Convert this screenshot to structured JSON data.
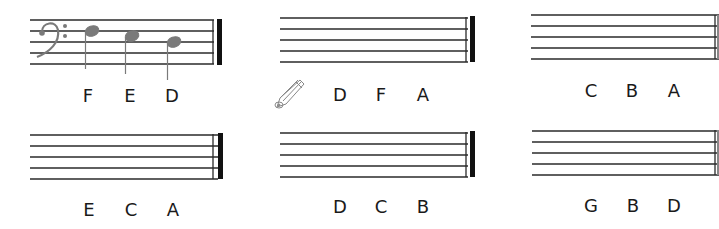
{
  "worksheet": {
    "exercises": [
      {
        "id": 1,
        "clef": "bass",
        "notes_drawn": [
          "F",
          "E",
          "D"
        ],
        "labels": [
          "F",
          "E",
          "D"
        ],
        "hint_icon": null
      },
      {
        "id": 2,
        "clef": null,
        "notes_drawn": [],
        "labels": [
          "D",
          "F",
          "A"
        ],
        "hint_icon": "pencil-icon"
      },
      {
        "id": 3,
        "clef": null,
        "notes_drawn": [],
        "labels": [
          "C",
          "B",
          "A"
        ],
        "hint_icon": null
      },
      {
        "id": 4,
        "clef": null,
        "notes_drawn": [],
        "labels": [
          "E",
          "C",
          "A"
        ],
        "hint_icon": null
      },
      {
        "id": 5,
        "clef": null,
        "notes_drawn": [],
        "labels": [
          "D",
          "C",
          "B"
        ],
        "hint_icon": null
      },
      {
        "id": 6,
        "clef": null,
        "notes_drawn": [],
        "labels": [
          "G",
          "B",
          "D"
        ],
        "hint_icon": null
      }
    ],
    "colors": {
      "staff_line": "#2a2a2a",
      "note": "#7a7a7a",
      "label": "#1a1a1a"
    }
  }
}
